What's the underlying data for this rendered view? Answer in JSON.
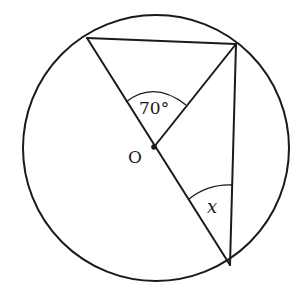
{
  "diagram": {
    "type": "circle-geometry",
    "circle": {
      "cx": 156,
      "cy": 148,
      "r": 133
    },
    "points": {
      "O": {
        "label": "O",
        "x": 154,
        "y": 147,
        "role": "center"
      },
      "A": {
        "x": 87,
        "y": 38
      },
      "B": {
        "x": 236,
        "y": 44
      },
      "C": {
        "x": 230,
        "y": 265
      }
    },
    "segments": [
      {
        "from": "A",
        "to": "B"
      },
      {
        "from": "A",
        "to": "C",
        "note": "diameter through O"
      },
      {
        "from": "O",
        "to": "B"
      },
      {
        "from": "B",
        "to": "C"
      }
    ],
    "angles": [
      {
        "vertex": "O",
        "between": [
          "A",
          "B"
        ],
        "label": "70°"
      },
      {
        "vertex": "C",
        "between": [
          "O",
          "B"
        ],
        "label": "x"
      }
    ],
    "labels": {
      "center": "O",
      "angle_at_center": "70°",
      "unknown_angle": "x"
    }
  }
}
